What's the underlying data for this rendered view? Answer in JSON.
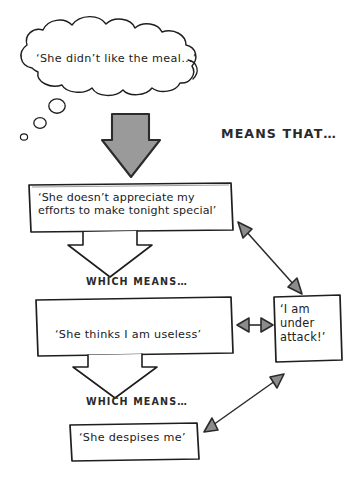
{
  "canvas": {
    "width": 361,
    "height": 480,
    "background": "#ffffff",
    "ink": "#1b1b1b",
    "arrow_fill": "#8c8c8c",
    "arrow_stroke": "#2b2b2b"
  },
  "thought_bubble": {
    "text": "‘She didn’t like the meal…’",
    "trail_bubbles": 3
  },
  "connectors": {
    "means_that_label": "MEANS THAT…",
    "which_means_label_1": "WHICH MEANS…",
    "which_means_label_2": "WHICH MEANS…"
  },
  "boxes": [
    {
      "id": "box-appreciate",
      "line1": "‘She doesn’t appreciate my",
      "line2": "efforts to make tonight special’"
    },
    {
      "id": "box-useless",
      "line1": "‘She thinks I am useless’"
    },
    {
      "id": "box-under-attack",
      "line1": "‘I am",
      "line2": "under",
      "line3": "attack!’"
    },
    {
      "id": "box-despises",
      "line1": "‘She despises me’"
    }
  ]
}
